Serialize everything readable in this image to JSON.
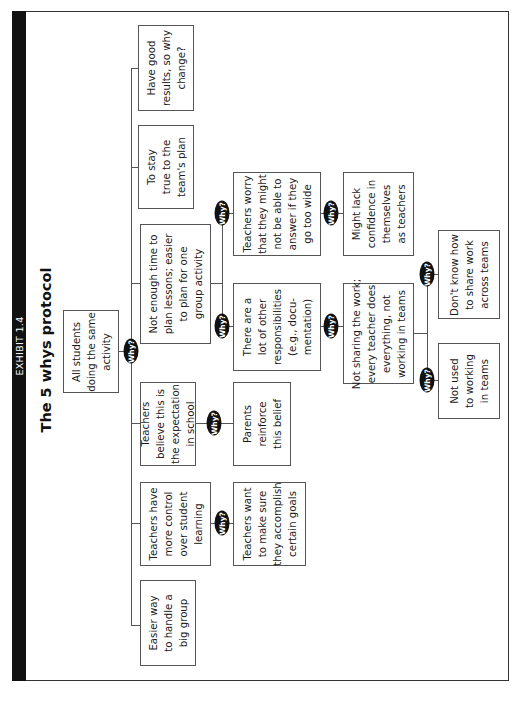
{
  "header": {
    "exhibit_label": "EXHIBIT 1.4",
    "title": "The 5 whys protocol"
  },
  "why_label": "Why?",
  "root": {
    "text": "All students\ndoing the same\nactivity"
  },
  "level1": [
    {
      "id": "have-good-results",
      "text": "Have good\nresults, so why\nchange?"
    },
    {
      "id": "stay-true",
      "text": "To stay\ntrue to the\nteam's plan"
    },
    {
      "id": "not-enough-time",
      "text": "Not enough time to\nplan lessons; easier\nto plan for one\ngroup activity"
    },
    {
      "id": "teachers-believe",
      "text": "Teachers\nbelieve this is\nthe expectation\nin school"
    },
    {
      "id": "more-control",
      "text": "Teachers have\nmore control\nover student\nlearning"
    },
    {
      "id": "easier-way",
      "text": "Easier way\nto handle a\nbig group"
    }
  ],
  "level2": {
    "teachers-worry": {
      "text": "Teachers worry\nthat they might\nnot be able to\nanswer if they\ngo too wide"
    },
    "other-responsibilities": {
      "text": "There are a\nlot of other\nresponsibilities\n(e.g., docu-\nmentation)"
    },
    "parents-reinforce": {
      "text": "Parents\nreinforce\nthis belief"
    },
    "teachers-want": {
      "text": "Teachers want\nto make sure\nthey accomplish\ncertain goals"
    }
  },
  "level3": {
    "lack-confidence": {
      "text": "Might lack\nconfidence in\nthemselves\nas teachers"
    },
    "not-sharing": {
      "text": "Not sharing the work;\nevery teacher does\neverything, not\nworking in teams"
    }
  },
  "level4": {
    "dont-know-how": {
      "text": "Don't know how\nto share work\nacross teams"
    },
    "not-used": {
      "text": "Not used\nto working\nin teams"
    }
  },
  "colors": {
    "bar": "#111111",
    "border": "#555555",
    "why_fill": "#111111",
    "why_text": "#ffffff"
  }
}
